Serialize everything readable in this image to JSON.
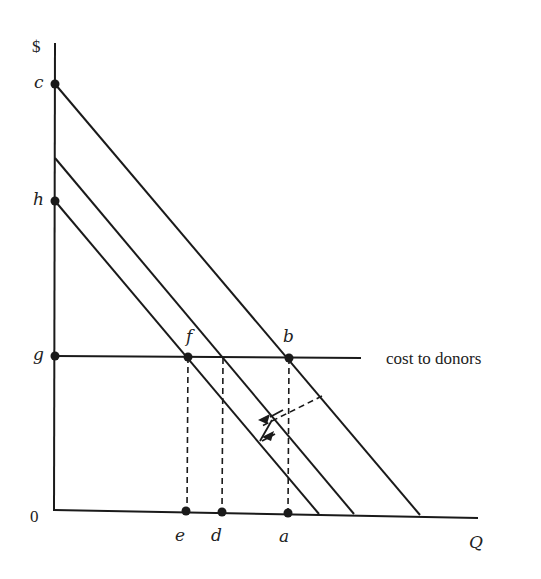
{
  "diagram": {
    "y_axis_label": "$",
    "x_axis_label": "Q",
    "origin_label": "0",
    "vertical_points": [
      {
        "id": "c",
        "label": "c"
      },
      {
        "id": "h",
        "label": "h"
      },
      {
        "id": "g",
        "label": "g"
      }
    ],
    "horizontal_points": [
      {
        "id": "e",
        "label": "e"
      },
      {
        "id": "d",
        "label": "d"
      },
      {
        "id": "a",
        "label": "a"
      }
    ],
    "curve_points": [
      {
        "id": "f",
        "label": "f"
      },
      {
        "id": "b",
        "label": "b"
      }
    ],
    "cost_line_label": "cost to donors",
    "lines": [
      {
        "name": "upper-demand-line",
        "from": "c",
        "to_x_intercept": "right"
      },
      {
        "name": "middle-demand-line",
        "from": "between c and h",
        "to_x_intercept": "middle"
      },
      {
        "name": "lower-demand-line",
        "from": "h",
        "to_x_intercept": "left"
      }
    ],
    "colors": {
      "ink": "#1a1a1a",
      "background": "#ffffff"
    }
  }
}
